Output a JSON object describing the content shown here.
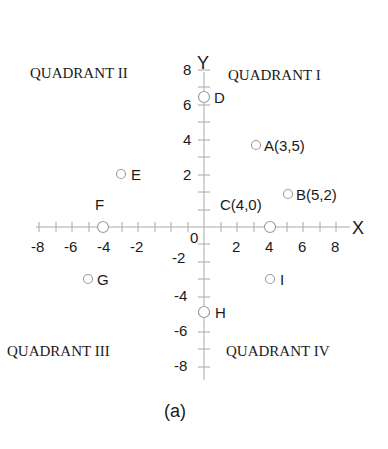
{
  "figure": {
    "caption": "(a)",
    "axis_labels": {
      "x": "X",
      "y": "Y"
    },
    "origin_label": "0",
    "quadrants": {
      "q1": "QUADRANT I",
      "q2": "QUADRANT II",
      "q3": "QUADRANT III",
      "q4": "QUADRANT IV"
    },
    "x_tick_labels": [
      "-8",
      "-6",
      "-4",
      "-2",
      "2",
      "4",
      "6",
      "8"
    ],
    "y_tick_labels": [
      "8",
      "6",
      "4",
      "2",
      "-2",
      "-4",
      "-6",
      "-8"
    ],
    "points": [
      {
        "name": "A",
        "label": "A(3,5)",
        "x": 3,
        "y": 5
      },
      {
        "name": "B",
        "label": "B(5,2)",
        "x": 5,
        "y": 2
      },
      {
        "name": "C",
        "label": "C(4,0)",
        "x": 4,
        "y": 0
      },
      {
        "name": "D",
        "label": "D",
        "x": 0,
        "y": 6
      },
      {
        "name": "E",
        "label": "E",
        "x": -5,
        "y": 3
      },
      {
        "name": "F",
        "label": "F",
        "x": -6,
        "y": 0
      },
      {
        "name": "G",
        "label": "G",
        "x": -7,
        "y": -3
      },
      {
        "name": "H",
        "label": "H",
        "x": 0,
        "y": -5
      },
      {
        "name": "I",
        "label": "I",
        "x": 4,
        "y": -3
      }
    ],
    "colors": {
      "axis": "#a8a8a8",
      "point_stroke": "#a0a0a0",
      "text": "#1a1a1a"
    }
  }
}
